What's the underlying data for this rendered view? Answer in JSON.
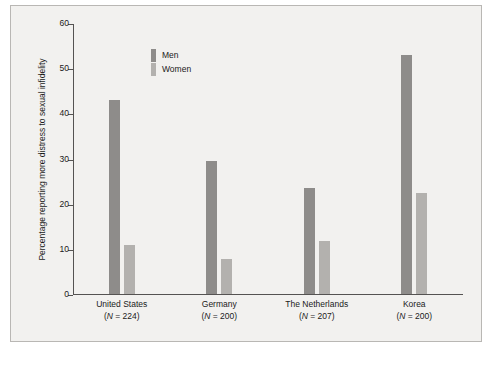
{
  "chart_data": {
    "type": "bar",
    "title": "",
    "xlabel": "",
    "ylabel": "Percentage reporting more distress to sexual infidelity",
    "ylim": [
      0,
      60
    ],
    "yticks": [
      0,
      10,
      20,
      30,
      40,
      50,
      60
    ],
    "grid": false,
    "legend_position": "top-left",
    "categories": [
      "United States",
      "Germany",
      "The Netherlands",
      "Korea"
    ],
    "category_lines": [
      [
        "United States",
        "(N = 224)"
      ],
      [
        "Germany",
        "(N = 200)"
      ],
      [
        "The Netherlands",
        "(N = 207)"
      ],
      [
        "Korea",
        "(N = 200)"
      ]
    ],
    "series": [
      {
        "name": "Men",
        "color": "#8e8c8a",
        "values": [
          43.0,
          29.5,
          23.5,
          53.0
        ]
      },
      {
        "name": "Women",
        "color": "#b3b1ae",
        "values": [
          10.8,
          7.8,
          11.8,
          22.3
        ]
      }
    ]
  },
  "legend": {
    "items": [
      {
        "label": "Men"
      },
      {
        "label": "Women"
      }
    ]
  },
  "caption": {
    "text": ""
  }
}
